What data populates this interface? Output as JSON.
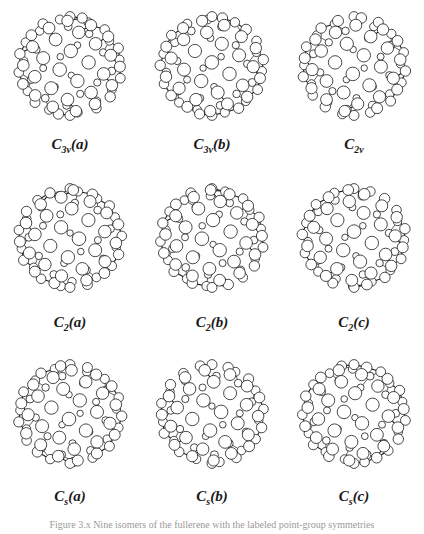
{
  "figure": {
    "rows": [
      {
        "items": [
          {
            "id": "c3v-a",
            "label_main": "C",
            "label_sub": "3v",
            "label_suffix": "(a)"
          },
          {
            "id": "c3v-b",
            "label_main": "C",
            "label_sub": "3v",
            "label_suffix": "(b)"
          },
          {
            "id": "c2v",
            "label_main": "C",
            "label_sub": "2v",
            "label_suffix": ""
          }
        ]
      },
      {
        "items": [
          {
            "id": "c2-a",
            "label_main": "C",
            "label_sub": "2",
            "label_suffix": "(a)"
          },
          {
            "id": "c2-b",
            "label_main": "C",
            "label_sub": "2",
            "label_suffix": "(b)"
          },
          {
            "id": "c2-c",
            "label_main": "C",
            "label_sub": "2",
            "label_suffix": "(c)"
          }
        ]
      },
      {
        "items": [
          {
            "id": "cs-a",
            "label_main": "C",
            "label_sub": "s",
            "label_suffix": "(a)"
          },
          {
            "id": "cs-b",
            "label_main": "C",
            "label_sub": "s",
            "label_suffix": "(b)"
          },
          {
            "id": "cs-c",
            "label_main": "C",
            "label_sub": "s",
            "label_suffix": "(c)"
          }
        ]
      }
    ],
    "caption": "Figure 3.x  Nine isomers of the fullerene with the labeled point-group symmetries"
  },
  "colors": {
    "ink": "#1a1a1a",
    "atom_fill": "#ffffff",
    "caption": "#9a9a9a"
  }
}
